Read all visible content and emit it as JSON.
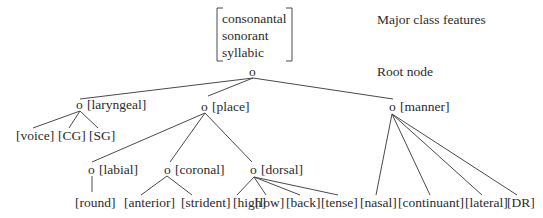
{
  "major_class": {
    "features": [
      "consonantal",
      "sonorant",
      "syllabic"
    ],
    "label": "Major class features"
  },
  "root": {
    "node": "o",
    "label": "Root node"
  },
  "nodes": {
    "laryngeal": {
      "node": "o",
      "label": "[laryngeal]",
      "children": [
        "[voice]",
        "[CG]",
        "[SG]"
      ]
    },
    "place": {
      "node": "o",
      "label": "[place]"
    },
    "manner": {
      "node": "o",
      "label": "[manner]",
      "children": [
        "[nasal]",
        "[continuant]",
        "[lateral]",
        "[DR]"
      ]
    },
    "labial": {
      "node": "o",
      "label": "[labial]",
      "children": [
        "[round]"
      ]
    },
    "coronal": {
      "node": "o",
      "label": "[coronal]",
      "children": [
        "[anterior]",
        "[strident]"
      ]
    },
    "dorsal": {
      "node": "o",
      "label": "[dorsal]",
      "children": [
        "[high]",
        "[low]",
        "[back]",
        "[tense]"
      ]
    }
  }
}
